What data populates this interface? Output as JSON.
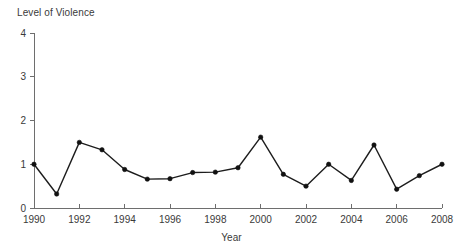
{
  "chart_data": {
    "type": "line",
    "title": "",
    "xlabel": "Year",
    "ylabel": "Level of Violence",
    "xlim": [
      1990,
      2008
    ],
    "ylim": [
      0,
      4
    ],
    "grid": false,
    "legend": null,
    "x_ticks": [
      1990,
      1992,
      1994,
      1996,
      1998,
      2000,
      2002,
      2004,
      2006,
      2008
    ],
    "y_ticks": [
      0,
      1,
      2,
      3,
      4
    ],
    "x": [
      1990,
      1991,
      1992,
      1993,
      1994,
      1995,
      1996,
      1997,
      1998,
      1999,
      2000,
      2001,
      2002,
      2003,
      2004,
      2005,
      2006,
      2007,
      2008
    ],
    "values": [
      1.0,
      0.32,
      1.5,
      1.33,
      0.88,
      0.66,
      0.67,
      0.81,
      0.82,
      0.92,
      1.62,
      0.77,
      0.5,
      1.0,
      0.63,
      1.44,
      0.43,
      0.74,
      1.0
    ],
    "series": [
      {
        "name": "Level of Violence",
        "marker": "filled-circle",
        "color": "#111111",
        "values": [
          1.0,
          0.32,
          1.5,
          1.33,
          0.88,
          0.66,
          0.67,
          0.81,
          0.82,
          0.92,
          1.62,
          0.77,
          0.5,
          1.0,
          0.63,
          1.44,
          0.43,
          0.74,
          1.0
        ]
      }
    ]
  },
  "labels": {
    "y_axis_title": "Level of Violence",
    "x_axis_title": "Year"
  }
}
